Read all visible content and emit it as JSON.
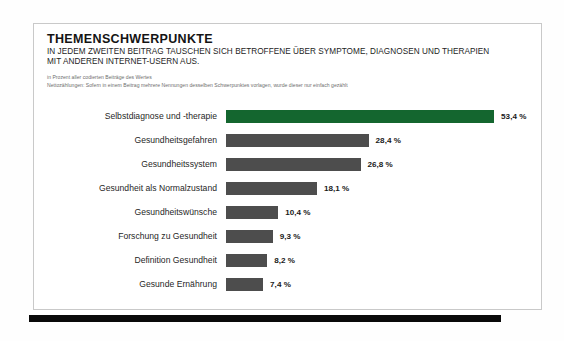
{
  "card": {
    "title": "THEMENSCHWERPUNKTE",
    "subtitle_line_1": "IN JEDEM ZWEITEN BEITRAG TAUSCHEN SICH BETROFFENE ÜBER SYMPTOME, DIAGNOSEN UND THERAPIEN",
    "subtitle_line_2": "MIT ANDEREN INTERNET-USERN AUS.",
    "note_1": "in Prozent aller codierten Beiträge des Wertes",
    "note_2": "Nettozählungen: Sofern in einem Beitrag mehrere Nennungen desselben Schwerpunktes vorlagen, wurde dieser nur einfach gezählt"
  },
  "colors": {
    "highlight": "#14662f",
    "bar": "#4d4d4d",
    "rule": "#090909",
    "card_border": "#c9c9c9"
  },
  "chart_data": {
    "type": "bar",
    "orientation": "horizontal",
    "title": "THEMENSCHWERPUNKTE",
    "subtitle": "IN JEDEM ZWEITEN BEITRAG TAUSCHEN SICH BETROFFENE ÜBER SYMPTOME, DIAGNOSEN UND THERAPIEN MIT ANDEREN INTERNET-USERN AUS.",
    "xlabel": "",
    "ylabel": "",
    "unit": "%",
    "xlim": [
      0,
      53.4
    ],
    "grid": false,
    "legend": false,
    "categories": [
      "Selbstdiagnose und -therapie",
      "Gesundheitsgefahren",
      "Gesundheitssystem",
      "Gesundheit als Normalzustand",
      "Gesundheitswünsche",
      "Forschung zu Gesundheit",
      "Definition Gesundheit",
      "Gesunde Ernährung"
    ],
    "values": [
      53.4,
      28.4,
      26.8,
      18.1,
      10.4,
      9.3,
      8.2,
      7.4
    ],
    "value_labels": [
      "53,4 %",
      "28,4 %",
      "26,8 %",
      "18,1 %",
      "10,4 %",
      "9,3 %",
      "8,2 %",
      "7,4 %"
    ],
    "bars": [
      {
        "label": "Selbstdiagnose und -therapie",
        "value": 53.4,
        "value_label": "53,4 %",
        "highlight": true
      },
      {
        "label": "Gesundheitsgefahren",
        "value": 28.4,
        "value_label": "28,4 %",
        "highlight": false
      },
      {
        "label": "Gesundheitssystem",
        "value": 26.8,
        "value_label": "26,8 %",
        "highlight": false
      },
      {
        "label": "Gesundheit als Normalzustand",
        "value": 18.1,
        "value_label": "18,1 %",
        "highlight": false
      },
      {
        "label": "Gesundheitswünsche",
        "value": 10.4,
        "value_label": "10,4 %",
        "highlight": false
      },
      {
        "label": "Forschung zu Gesundheit",
        "value": 9.3,
        "value_label": "9,3 %",
        "highlight": false
      },
      {
        "label": "Definition Gesundheit",
        "value": 8.2,
        "value_label": "8,2 %",
        "highlight": false
      },
      {
        "label": "Gesunde Ernährung",
        "value": 7.4,
        "value_label": "7,4 %",
        "highlight": false
      }
    ]
  }
}
